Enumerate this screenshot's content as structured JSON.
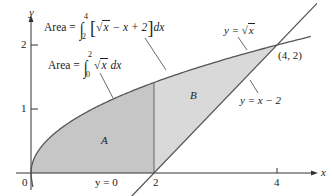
{
  "figure": {
    "type": "area-between-curves",
    "colors": {
      "region_a": "#c6c6c6",
      "region_b": "#d9d9d9",
      "curve": "#555555",
      "axis": "#333333",
      "text": "#222222"
    }
  },
  "axes": {
    "x_label": "x",
    "y_label": "y",
    "x_ticks": [
      {
        "value": 0,
        "label": "0"
      },
      {
        "value": 2,
        "label": "2"
      },
      {
        "value": 4,
        "label": "4"
      }
    ],
    "y_ticks": [
      {
        "value": 1,
        "label": "1"
      },
      {
        "value": 2,
        "label": "2"
      }
    ]
  },
  "curves": {
    "sqrt": {
      "label_prefix": "y = ",
      "label_sym": "√",
      "label_var": "x"
    },
    "line": {
      "label": "y = x − 2"
    },
    "baseline": {
      "label": "y = 0"
    }
  },
  "regions": {
    "a": {
      "label": "A"
    },
    "b": {
      "label": "B"
    }
  },
  "intersection": {
    "label": "(4, 2)"
  },
  "formulas": {
    "area_b": {
      "prefix": "Area = ",
      "upper": "4",
      "lower": "2",
      "open_bracket": "[",
      "radicand": "x",
      "rest": " − x + 2",
      "close_bracket": "]",
      "differential": "dx"
    },
    "area_a": {
      "prefix": "Area = ",
      "upper": "2",
      "lower": "0",
      "radicand": "x",
      "differential": "dx"
    }
  }
}
